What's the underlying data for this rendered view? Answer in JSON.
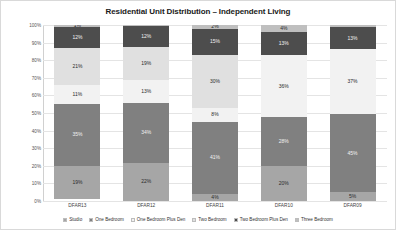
{
  "chart_data": {
    "type": "bar",
    "subtype": "stacked-percentage-column",
    "title": "Residential Unit Distribution – Independent Living",
    "xlabel": "",
    "ylabel": "",
    "ylim": [
      0,
      100
    ],
    "grid": true,
    "legend_position": "bottom",
    "categories": [
      "DFAR13",
      "DFAR12",
      "DFAR11",
      "DFAR10",
      "DFAR09"
    ],
    "ytick_labels": [
      "0%",
      "10%",
      "20%",
      "30%",
      "40%",
      "50%",
      "60%",
      "70%",
      "80%",
      "90%",
      "100%"
    ],
    "ytick_values": [
      0,
      10,
      20,
      30,
      40,
      50,
      60,
      70,
      80,
      90,
      100
    ],
    "series": [
      {
        "name": "Studio",
        "color": "#a6a6a6",
        "values": [
          19,
          22,
          4,
          20,
          5
        ],
        "labels": [
          "19%",
          "22%",
          "4%",
          "20%",
          "5%"
        ]
      },
      {
        "name": "One Bedroom",
        "color": "#808080",
        "values": [
          35,
          34,
          41,
          28,
          45
        ],
        "labels": [
          "35%",
          "34%",
          "41%",
          "28%",
          "45%"
        ]
      },
      {
        "name": "One Bedroom Plus Den",
        "color": "#f2f2f2",
        "values": [
          11,
          13,
          8,
          36,
          37
        ],
        "labels": [
          "11%",
          "13%",
          "8%",
          "36%",
          "37%"
        ]
      },
      {
        "name": "Two Bedroom",
        "color": "#e0e0e0",
        "values": [
          21,
          19,
          30,
          0,
          0
        ],
        "labels": [
          "21%",
          "19%",
          "30%",
          "",
          ""
        ]
      },
      {
        "name": "Two Bedroom Plus Den",
        "color": "#4d4d4d",
        "values": [
          12,
          12,
          15,
          13,
          13
        ],
        "labels": [
          "12%",
          "12%",
          "15%",
          "13%",
          "13%"
        ]
      },
      {
        "name": "Three Bedroom",
        "color": "#bfbfbf",
        "values": [
          1,
          0.7,
          2,
          4,
          1
        ],
        "labels": [
          "1%",
          "0.7%",
          "2%",
          "4%",
          "1%"
        ],
        "label_outside": [
          false,
          true,
          false,
          false,
          true
        ]
      }
    ]
  },
  "legend": {
    "items": [
      {
        "label": "Studio",
        "color": "#a6a6a6"
      },
      {
        "label": "One Bedroom",
        "color": "#808080"
      },
      {
        "label": "One Bedroom Plus Den",
        "color": "#f2f2f2"
      },
      {
        "label": "Two Bedroom",
        "color": "#e0e0e0"
      },
      {
        "label": "Two Bedroom Plus Den",
        "color": "#4d4d4d"
      },
      {
        "label": "Three Bedroom",
        "color": "#bfbfbf"
      }
    ]
  }
}
